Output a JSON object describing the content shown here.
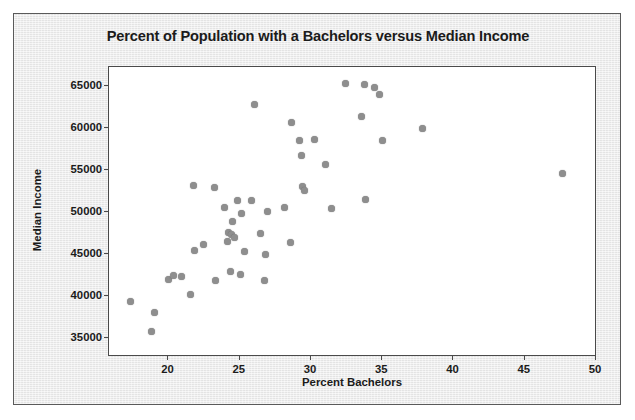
{
  "chart_data": {
    "type": "scatter",
    "title": "Percent of Population with a Bachelors versus Median Income",
    "xlabel": "Percent Bachelors",
    "ylabel": "Median Income",
    "xlim": [
      15.9,
      50.0
    ],
    "ylim": [
      32900,
      67100
    ],
    "xticks": [
      20,
      25,
      30,
      35,
      40,
      45,
      50
    ],
    "xtick_labels": [
      "20",
      "25",
      "30",
      "35",
      "40",
      "45",
      "50"
    ],
    "yticks": [
      35000,
      40000,
      45000,
      50000,
      55000,
      60000,
      65000
    ],
    "ytick_labels": [
      "35000",
      "40000",
      "45000",
      "50000",
      "55000",
      "60000",
      "65000"
    ],
    "grid": false,
    "legend": false,
    "marker_color": "#8e8e8e",
    "marker_size": 7,
    "points": [
      {
        "x": 17.4,
        "y": 39200
      },
      {
        "x": 18.9,
        "y": 35700
      },
      {
        "x": 19.1,
        "y": 38000
      },
      {
        "x": 20.1,
        "y": 41900
      },
      {
        "x": 20.4,
        "y": 42300
      },
      {
        "x": 21.0,
        "y": 42200
      },
      {
        "x": 21.6,
        "y": 40100
      },
      {
        "x": 21.8,
        "y": 53000
      },
      {
        "x": 21.9,
        "y": 45300
      },
      {
        "x": 22.5,
        "y": 46000
      },
      {
        "x": 23.3,
        "y": 52800
      },
      {
        "x": 23.4,
        "y": 41700
      },
      {
        "x": 24.0,
        "y": 50400
      },
      {
        "x": 24.2,
        "y": 46400
      },
      {
        "x": 24.3,
        "y": 47400
      },
      {
        "x": 24.4,
        "y": 42800
      },
      {
        "x": 24.5,
        "y": 47200
      },
      {
        "x": 24.6,
        "y": 48700
      },
      {
        "x": 24.7,
        "y": 46900
      },
      {
        "x": 24.9,
        "y": 51200
      },
      {
        "x": 25.1,
        "y": 42500
      },
      {
        "x": 25.2,
        "y": 49700
      },
      {
        "x": 25.4,
        "y": 45200
      },
      {
        "x": 25.9,
        "y": 51300
      },
      {
        "x": 26.1,
        "y": 62600
      },
      {
        "x": 26.5,
        "y": 47300
      },
      {
        "x": 26.8,
        "y": 41700
      },
      {
        "x": 26.9,
        "y": 44800
      },
      {
        "x": 27.0,
        "y": 50000
      },
      {
        "x": 28.2,
        "y": 50400
      },
      {
        "x": 28.6,
        "y": 46300
      },
      {
        "x": 28.7,
        "y": 60500
      },
      {
        "x": 29.3,
        "y": 58400
      },
      {
        "x": 29.4,
        "y": 56600
      },
      {
        "x": 29.5,
        "y": 52900
      },
      {
        "x": 29.6,
        "y": 52400
      },
      {
        "x": 30.3,
        "y": 58500
      },
      {
        "x": 31.1,
        "y": 55500
      },
      {
        "x": 31.5,
        "y": 50300
      },
      {
        "x": 32.5,
        "y": 65100
      },
      {
        "x": 33.6,
        "y": 61200
      },
      {
        "x": 33.8,
        "y": 65000
      },
      {
        "x": 33.9,
        "y": 51400
      },
      {
        "x": 34.5,
        "y": 64700
      },
      {
        "x": 34.9,
        "y": 63800
      },
      {
        "x": 35.1,
        "y": 58400
      },
      {
        "x": 37.9,
        "y": 59800
      },
      {
        "x": 47.7,
        "y": 54400
      }
    ]
  }
}
